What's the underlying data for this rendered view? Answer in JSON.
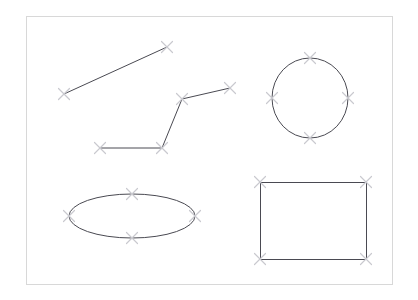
{
  "canvas": {
    "width": 418,
    "height": 300,
    "background_color": "#ffffff",
    "title": "Geometric Shapes Sketch Canvas"
  },
  "frame": {
    "name": "drawing-frame",
    "x": 26,
    "y": 16,
    "width": 366,
    "height": 268,
    "stroke_color": "#d8d8d8",
    "stroke_width": 1,
    "fill": "none"
  },
  "style": {
    "shape_stroke_color": "#4a4a52",
    "shape_stroke_width": 1,
    "shape_fill": "none",
    "marker_stroke_color": "#c9c9cf",
    "marker_stroke_width": 1.2,
    "marker_size": 11
  },
  "shapes": [
    {
      "id": "line-segment",
      "name": "line-segment",
      "type": "line",
      "label": "Line Segment",
      "points": [
        {
          "x": 64,
          "y": 94
        },
        {
          "x": 167,
          "y": 47
        }
      ]
    },
    {
      "id": "polyline",
      "name": "polyline-path",
      "type": "polyline",
      "label": "Polyline",
      "points": [
        {
          "x": 100,
          "y": 148
        },
        {
          "x": 162,
          "y": 148
        },
        {
          "x": 182,
          "y": 99
        },
        {
          "x": 230,
          "y": 88
        }
      ]
    },
    {
      "id": "circle",
      "name": "circle-shape",
      "type": "ellipse",
      "label": "Circle",
      "cx": 310,
      "cy": 98,
      "rx": 38,
      "ry": 40,
      "points": [
        {
          "x": 310,
          "y": 58
        },
        {
          "x": 348,
          "y": 98
        },
        {
          "x": 310,
          "y": 138
        },
        {
          "x": 272,
          "y": 98
        }
      ]
    },
    {
      "id": "ellipse",
      "name": "ellipse-shape",
      "type": "ellipse",
      "label": "Ellipse",
      "cx": 132,
      "cy": 216,
      "rx": 63,
      "ry": 22,
      "points": [
        {
          "x": 132,
          "y": 194
        },
        {
          "x": 195,
          "y": 216
        },
        {
          "x": 132,
          "y": 238
        },
        {
          "x": 69,
          "y": 216
        }
      ]
    },
    {
      "id": "rectangle",
      "name": "rectangle-shape",
      "type": "rect",
      "label": "Rectangle",
      "x": 260,
      "y": 182,
      "width": 106,
      "height": 77,
      "points": [
        {
          "x": 260,
          "y": 182
        },
        {
          "x": 366,
          "y": 182
        },
        {
          "x": 366,
          "y": 259
        },
        {
          "x": 260,
          "y": 259
        }
      ]
    }
  ],
  "vertex_markers": {
    "name": "vertex-marker",
    "glyph": "x-cross-icon",
    "count": 18
  }
}
